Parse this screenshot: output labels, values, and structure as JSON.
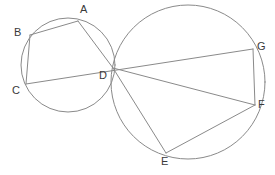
{
  "figure": {
    "type": "geometry-diagram",
    "width": 275,
    "height": 175,
    "background_color": "#ffffff",
    "stroke_color": "#8a8a8a",
    "label_color": "#3a3a3a",
    "label_font_size": 11,
    "stroke_width": 1
  },
  "circles": [
    {
      "name": "left-circle",
      "cx": 68,
      "cy": 65,
      "r": 47
    },
    {
      "name": "right-circle",
      "cx": 188,
      "cy": 82,
      "r": 77
    }
  ],
  "points": [
    {
      "id": "A",
      "label": "A",
      "x": 78,
      "y": 21,
      "label_x": 80,
      "label_y": 4
    },
    {
      "id": "B",
      "label": "B",
      "x": 30,
      "y": 35,
      "label_x": 14,
      "label_y": 27
    },
    {
      "id": "C",
      "label": "C",
      "x": 26,
      "y": 84,
      "label_x": 12,
      "label_y": 85
    },
    {
      "id": "D",
      "label": "D",
      "x": 113,
      "y": 68,
      "label_x": 99,
      "label_y": 70
    },
    {
      "id": "E",
      "label": "E",
      "x": 166,
      "y": 153,
      "label_x": 161,
      "label_y": 156
    },
    {
      "id": "F",
      "label": "F",
      "x": 255,
      "y": 105,
      "label_x": 258,
      "label_y": 99
    },
    {
      "id": "G",
      "label": "G",
      "x": 253,
      "y": 49,
      "label_x": 257,
      "label_y": 41
    }
  ],
  "segments": [
    {
      "name": "segment-AB",
      "from": "A",
      "to": "B",
      "x1": 78,
      "y1": 21,
      "x2": 30,
      "y2": 35
    },
    {
      "name": "segment-BC",
      "from": "B",
      "to": "C",
      "x1": 30,
      "y1": 35,
      "x2": 26,
      "y2": 84
    },
    {
      "name": "segment-CG",
      "from": "C",
      "to": "G",
      "x1": 26,
      "y1": 84,
      "x2": 253,
      "y2": 49
    },
    {
      "name": "segment-AD",
      "from": "A",
      "to": "D",
      "x1": 78,
      "y1": 21,
      "x2": 113,
      "y2": 68
    },
    {
      "name": "segment-DE",
      "from": "D",
      "to": "E",
      "x1": 113,
      "y1": 68,
      "x2": 166,
      "y2": 153
    },
    {
      "name": "segment-DF",
      "from": "D",
      "to": "F",
      "x1": 113,
      "y1": 68,
      "x2": 255,
      "y2": 105
    },
    {
      "name": "segment-EF",
      "from": "E",
      "to": "F",
      "x1": 166,
      "y1": 153,
      "x2": 255,
      "y2": 105
    },
    {
      "name": "segment-FG",
      "from": "F",
      "to": "G",
      "x1": 255,
      "y1": 105,
      "x2": 253,
      "y2": 49
    }
  ]
}
